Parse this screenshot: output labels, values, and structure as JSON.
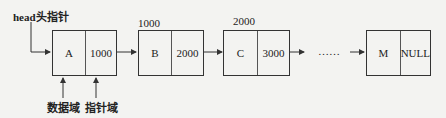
{
  "head_label": "head头指针",
  "nodes": [
    {
      "data": "A",
      "pointer": "1000",
      "address": ""
    },
    {
      "data": "B",
      "pointer": "2000",
      "address": "1000"
    },
    {
      "data": "C",
      "pointer": "3000",
      "address": "2000"
    },
    {
      "data": "M",
      "pointer": "NULL",
      "address": ""
    }
  ],
  "ellipsis": "……",
  "field_labels": {
    "data_field": "数据域",
    "pointer_field": "指针域"
  }
}
